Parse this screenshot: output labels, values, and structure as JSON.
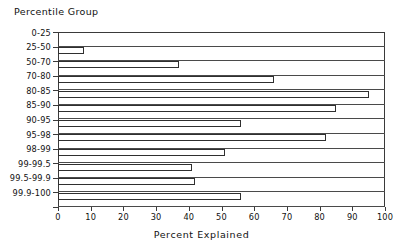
{
  "chart_data": {
    "type": "bar",
    "orientation": "horizontal",
    "title": "",
    "ylabel": "Percentile Group",
    "xlabel": "Percent Explained",
    "xlim": [
      0,
      100
    ],
    "xticks": [
      0,
      10,
      20,
      30,
      40,
      50,
      60,
      70,
      80,
      90,
      100
    ],
    "xtick_labels": [
      "0",
      "10",
      "20",
      "30",
      "40",
      "50",
      "60",
      "70",
      "80",
      "90",
      "100"
    ],
    "grid": false,
    "legend": null,
    "categories": [
      "0-25",
      "25-50",
      "50-70",
      "70-80",
      "80-85",
      "85-90",
      "90-95",
      "95-98",
      "98-99",
      "99-99.5",
      "99.5-99.9",
      "99.9-100"
    ],
    "values": [
      0,
      8,
      37,
      66,
      95,
      85,
      56,
      82,
      51,
      41,
      42,
      56
    ],
    "bar_fill": "#ffffff",
    "bar_edge": "#2f2f2f",
    "axis_color": "#3a3a3a",
    "text_color": "#111111",
    "background": "#ffffff"
  }
}
